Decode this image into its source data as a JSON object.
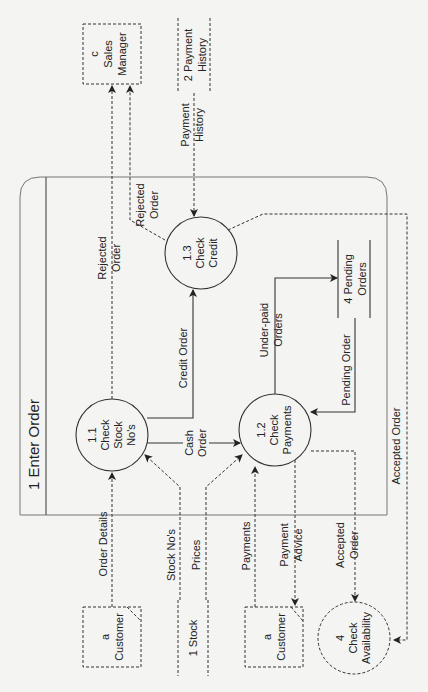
{
  "diagram": {
    "type": "data-flow-diagram",
    "orientation": "rotated-90-ccw",
    "process_box": {
      "id": "1",
      "title": "1 Enter Order"
    },
    "processes": [
      {
        "id": "1.1",
        "line1": "1.1",
        "line2": "Check",
        "line3": "Stock",
        "line4": "No's"
      },
      {
        "id": "1.2",
        "line1": "1.2",
        "line2": "Check",
        "line3": "Payments"
      },
      {
        "id": "1.3",
        "line1": "1.3",
        "line2": "Check",
        "line3": "Credit"
      },
      {
        "id": "4",
        "line1": "4",
        "line2": "Check",
        "line3": "Availability"
      }
    ],
    "entities": [
      {
        "id": "c",
        "line1": "c",
        "line2": "Sales",
        "line3": "Manager"
      },
      {
        "id": "a1",
        "line1": "a",
        "line2": "Customer"
      },
      {
        "id": "a2",
        "line1": "a",
        "line2": "Customer"
      }
    ],
    "stores": [
      {
        "id": "2",
        "line1": "2 Payment",
        "line2": "History"
      },
      {
        "id": "1",
        "line1": "1 Stock"
      },
      {
        "id": "4",
        "line1": "4 Pending",
        "line2": "Orders"
      }
    ],
    "flows": {
      "rejected_order_1": {
        "line1": "Rejected",
        "line2": "Order"
      },
      "rejected_order_2": {
        "line1": "Rejected",
        "line2": "Order"
      },
      "payment_history": {
        "line1": "Payment",
        "line2": "History"
      },
      "credit_order": {
        "line1": "Credit Order"
      },
      "cash_order": {
        "line1": "Cash",
        "line2": "Order"
      },
      "under_paid_orders": {
        "line1": "Under-paid",
        "line2": "Orders"
      },
      "pending_order": {
        "line1": "Pending Order"
      },
      "accepted_order_long": {
        "line1": "Accepted Order"
      },
      "order_details": {
        "line1": "Order Details"
      },
      "stock_nos": {
        "line1": "Stock No's"
      },
      "prices": {
        "line1": "Prices"
      },
      "payments": {
        "line1": "Payments"
      },
      "payment_advice": {
        "line1": "Payment",
        "line2": "Advice"
      },
      "accepted_order_short": {
        "line1": "Accepted",
        "line2": "Order"
      }
    }
  }
}
